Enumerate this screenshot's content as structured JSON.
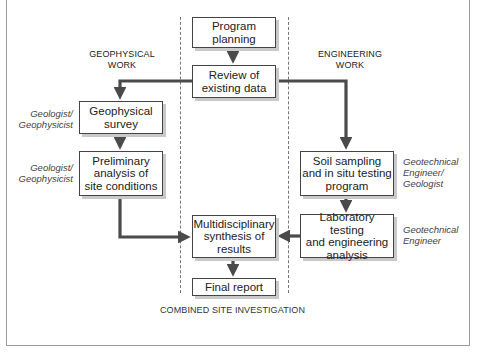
{
  "headings": {
    "left": "GEOPHYSICAL\nWORK",
    "right": "ENGINEERING\nWORK",
    "bottom": "COMBINED SITE INVESTIGATION"
  },
  "boxes": {
    "program_planning": "Program\nplanning",
    "review_existing_data": "Review of\nexisting data",
    "geophysical_survey": "Geophysical\nsurvey",
    "preliminary_analysis": "Preliminary\nanalysis of\nsite conditions",
    "soil_sampling": "Soil sampling\nand in situ testing\nprogram",
    "laboratory_testing": "Laboratory testing\nand engineering\nanalysis",
    "multidisciplinary_synthesis": "Multidisciplinary\nsynthesis of\nresults",
    "final_report": "Final report"
  },
  "roles": {
    "geophysical_survey": "Geologist/\nGeophysicist",
    "preliminary_analysis": "Geologist/\nGeophysicist",
    "soil_sampling": "Geotechnical\nEngineer/\nGeologist",
    "laboratory_testing": "Geotechnical\nEngineer"
  },
  "colors": {
    "arrow": "#4a4a4a",
    "box_border": "#444444",
    "box_shadow": "#c9c9c9",
    "dashed_divider": "#777777",
    "frame": "#9a9a9a"
  },
  "connections": [
    {
      "from": "Program planning",
      "to": "Review of existing data"
    },
    {
      "from": "Review of existing data",
      "to": "Geophysical survey"
    },
    {
      "from": "Review of existing data",
      "to": "Soil sampling and in situ testing program"
    },
    {
      "from": "Geophysical survey",
      "to": "Preliminary analysis of site conditions"
    },
    {
      "from": "Soil sampling and in situ testing program",
      "to": "Laboratory testing and engineering analysis"
    },
    {
      "from": "Preliminary analysis of site conditions",
      "to": "Multidisciplinary synthesis of results"
    },
    {
      "from": "Laboratory testing and engineering analysis",
      "to": "Multidisciplinary synthesis of results"
    },
    {
      "from": "Multidisciplinary synthesis of results",
      "to": "Final report"
    }
  ]
}
